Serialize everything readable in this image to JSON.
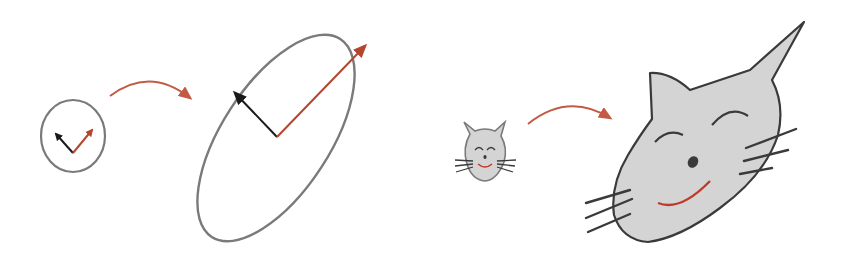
{
  "figure": {
    "colors": {
      "outline": "#7a7a7a",
      "black_vector": "#1a1a1a",
      "red_vector": "#b5452f",
      "transform_arrow": "#c25a44",
      "cat_fill": "#d4d4d4",
      "cat_outline": "#3a3a3a",
      "cat_smile": "#c0392b"
    },
    "panels": [
      {
        "name": "unit-circle",
        "shape": "circle",
        "vectors": [
          "black",
          "red"
        ]
      },
      {
        "name": "transformed-ellipse",
        "shape": "ellipse",
        "vectors": [
          "black",
          "red"
        ]
      },
      {
        "name": "small-cat",
        "shape": "cat-face"
      },
      {
        "name": "transformed-cat",
        "shape": "cat-face-stretched"
      }
    ],
    "arrows": [
      {
        "from": "unit-circle",
        "to": "transformed-ellipse"
      },
      {
        "from": "small-cat",
        "to": "transformed-cat"
      }
    ]
  }
}
